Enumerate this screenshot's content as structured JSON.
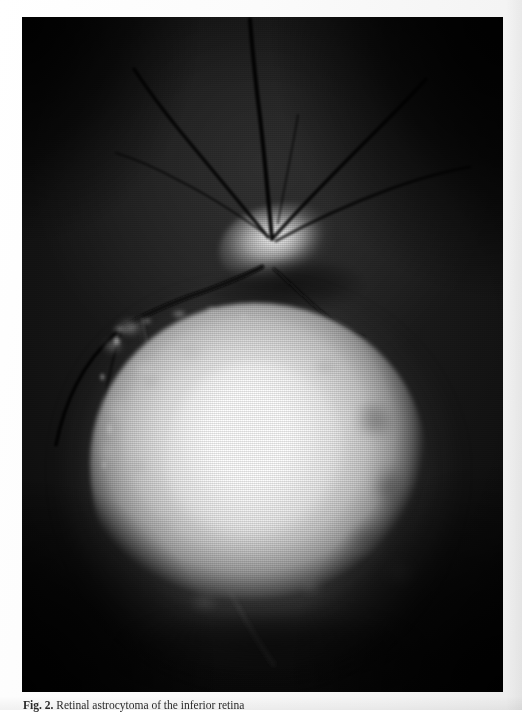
{
  "figure": {
    "caption_prefix": "Fig. 2.",
    "caption_text": "Retinal astrocytoma of the inferior retina",
    "caption_full": "Fig. 2. Retinal astrocytoma of the inferior retina",
    "modality": "fundus-photograph",
    "color_mode": "grayscale"
  },
  "photo": {
    "background_color": "#000000",
    "highlight_color": "#ffffff",
    "midtone_color": "#8a8a8a",
    "retina_base_color": "#1d1d1d",
    "alt_text": "Grayscale fundus photograph: dark retina with optic disc in upper center and a large bright mottled elevated mass occupying the inferior fundus"
  },
  "features": [
    {
      "name": "optic-disc",
      "label": "Optic disc"
    },
    {
      "name": "retinal-vessels",
      "label": "Retinal vessels"
    },
    {
      "name": "retinal-mass",
      "label": "Elevated whitish retinal mass"
    },
    {
      "name": "vignette",
      "label": "Peripheral vignetting"
    }
  ],
  "page": {
    "background_color": "#fdfdfd",
    "text_color": "#2b2b2b"
  }
}
